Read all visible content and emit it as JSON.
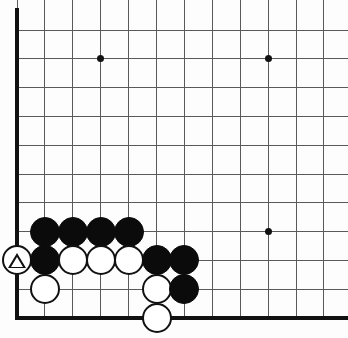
{
  "board": {
    "title": "Go board diagram",
    "type": "go-board-corner",
    "background_color": "#fdfdfd",
    "line_color": "#5a5a5a",
    "edge_color": "#111111",
    "width": 348,
    "height": 338,
    "origin_x": 17,
    "origin_y": 30,
    "col_spacing": 27.9,
    "row_spacing": 28.8,
    "cols": 12,
    "rows": 11,
    "left_edge_x": 17,
    "bottom_edge_y": 318,
    "stone_radius": 15,
    "star_points": [
      {
        "name": "star-point-upper-left",
        "col": 3,
        "row": 1
      },
      {
        "name": "star-point-upper-right",
        "col": 9,
        "row": 1
      },
      {
        "name": "star-point-lower-right",
        "col": 9,
        "row": 7
      }
    ],
    "stones": [
      {
        "id": "b1",
        "color": "black",
        "col": 1,
        "row": 7,
        "mark": ""
      },
      {
        "id": "b2",
        "color": "black",
        "col": 2,
        "row": 7,
        "mark": ""
      },
      {
        "id": "b3",
        "color": "black",
        "col": 3,
        "row": 7,
        "mark": ""
      },
      {
        "id": "b4",
        "color": "black",
        "col": 4,
        "row": 7,
        "mark": ""
      },
      {
        "id": "w-tri",
        "color": "white",
        "col": 0,
        "row": 8,
        "mark": "triangle"
      },
      {
        "id": "b5",
        "color": "black",
        "col": 1,
        "row": 8,
        "mark": ""
      },
      {
        "id": "w1",
        "color": "white",
        "col": 2,
        "row": 8,
        "mark": ""
      },
      {
        "id": "w2",
        "color": "white",
        "col": 3,
        "row": 8,
        "mark": ""
      },
      {
        "id": "w3",
        "color": "white",
        "col": 4,
        "row": 8,
        "mark": ""
      },
      {
        "id": "b6",
        "color": "black",
        "col": 5,
        "row": 8,
        "mark": ""
      },
      {
        "id": "b7",
        "color": "black",
        "col": 6,
        "row": 8,
        "mark": ""
      },
      {
        "id": "w4",
        "color": "white",
        "col": 1,
        "row": 9,
        "mark": ""
      },
      {
        "id": "w5",
        "color": "white",
        "col": 5,
        "row": 9,
        "mark": ""
      },
      {
        "id": "b8",
        "color": "black",
        "col": 6,
        "row": 9,
        "mark": ""
      },
      {
        "id": "w6",
        "color": "white",
        "col": 5,
        "row": 10,
        "mark": ""
      }
    ],
    "marks": {
      "triangle_label": "triangle-mark"
    }
  }
}
